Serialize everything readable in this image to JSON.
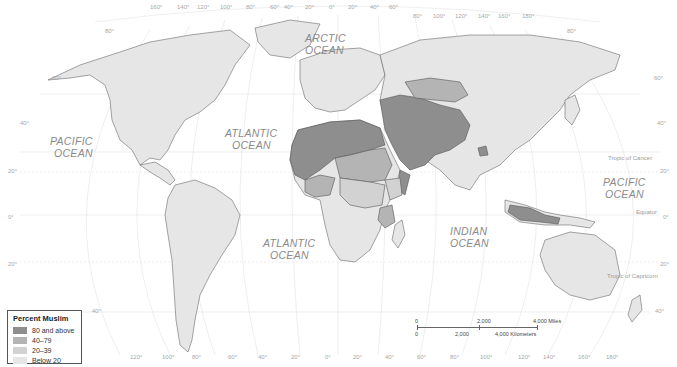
{
  "map": {
    "title": "Percent Muslim world map",
    "oceans": [
      {
        "name": "ARCTIC",
        "line2": "OCEAN"
      },
      {
        "name": "PACIFIC",
        "line2": "OCEAN"
      },
      {
        "name": "ATLANTIC",
        "line2": "OCEAN"
      },
      {
        "name": "ATLANTIC",
        "line2": "OCEAN"
      },
      {
        "name": "INDIAN",
        "line2": "OCEAN"
      },
      {
        "name": "PACIFIC",
        "line2": "OCEAN"
      }
    ],
    "reference_lines": {
      "tropic_cancer": "Tropic of Cancer",
      "equator": "Equator",
      "tropic_capricorn": "Tropic of Capricorn"
    },
    "top_longitudes": [
      "160°",
      "140°",
      "120°",
      "100°",
      "80°",
      "60°",
      "40°",
      "20°",
      "0°",
      "20°",
      "40°",
      "60°",
      "80°",
      "100°",
      "120°",
      "140°",
      "160°",
      "180°"
    ],
    "bottom_longitudes": [
      "120°",
      "100°",
      "80°",
      "60°",
      "40°",
      "20°",
      "0°",
      "20°",
      "40°",
      "60°",
      "80°",
      "100°",
      "120°",
      "140°",
      "160°",
      "180°"
    ],
    "left_latitudes": [
      "80°",
      "60°",
      "40°",
      "20°",
      "0°",
      "20°",
      "40°"
    ],
    "right_latitudes": [
      "80°",
      "60°",
      "40°",
      "20°",
      "0°",
      "20°",
      "40°"
    ]
  },
  "legend": {
    "title": "Percent Muslim",
    "items": [
      {
        "label": "80 and above",
        "color": "#8e8e8e"
      },
      {
        "label": "40–79",
        "color": "#b4b4b4"
      },
      {
        "label": "20–39",
        "color": "#d2d2d2"
      },
      {
        "label": "Below 20",
        "color": "#e6e6e6"
      }
    ]
  },
  "scale": {
    "miles": [
      "0",
      "2,000",
      "4,000 Miles"
    ],
    "km": [
      "0",
      "2,000",
      "4,000 Kilometers"
    ]
  },
  "colors": {
    "high": "#8e8e8e",
    "mid": "#b4b4b4",
    "low": "#d2d2d2",
    "base": "#e6e6e6",
    "border": "#555555",
    "graticule": "#dcdcdc"
  }
}
